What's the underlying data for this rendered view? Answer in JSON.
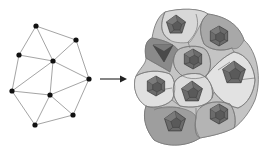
{
  "figure": {
    "left_panel": {
      "title": "point graph",
      "node_color": "#111111",
      "edge_color": "#9a9a9a",
      "nodes": [
        {
          "id": "n0",
          "x": 36,
          "y": 26
        },
        {
          "id": "n1",
          "x": 76,
          "y": 40
        },
        {
          "id": "n2",
          "x": 19,
          "y": 55
        },
        {
          "id": "n3",
          "x": 53,
          "y": 61
        },
        {
          "id": "n4",
          "x": 89,
          "y": 79
        },
        {
          "id": "n5",
          "x": 12,
          "y": 91
        },
        {
          "id": "n6",
          "x": 50,
          "y": 95
        },
        {
          "id": "n7",
          "x": 73,
          "y": 115
        },
        {
          "id": "n8",
          "x": 35,
          "y": 125
        }
      ],
      "edges": [
        [
          "n0",
          "n1"
        ],
        [
          "n0",
          "n2"
        ],
        [
          "n0",
          "n3"
        ],
        [
          "n1",
          "n3"
        ],
        [
          "n1",
          "n4"
        ],
        [
          "n2",
          "n3"
        ],
        [
          "n2",
          "n5"
        ],
        [
          "n3",
          "n4"
        ],
        [
          "n3",
          "n5"
        ],
        [
          "n3",
          "n6"
        ],
        [
          "n4",
          "n6"
        ],
        [
          "n4",
          "n7"
        ],
        [
          "n5",
          "n6"
        ],
        [
          "n5",
          "n8"
        ],
        [
          "n6",
          "n7"
        ],
        [
          "n6",
          "n8"
        ],
        [
          "n7",
          "n8"
        ]
      ]
    },
    "arrow": {
      "x1": 100,
      "y1": 79,
      "x2": 127,
      "y2": 79,
      "color": "#222222"
    },
    "right_panel": {
      "title": "cell tessellation",
      "outline_color": "#6f6f6f",
      "cells": [
        {
          "id": "c_top",
          "cx": 176,
          "cy": 25,
          "shade": "#d8d8d8",
          "poly": "pentagon",
          "poly_r": 10
        },
        {
          "id": "c_topright",
          "cx": 219,
          "cy": 36,
          "shade": "#a8a8a8",
          "poly": "hexagon",
          "poly_r": 10
        },
        {
          "id": "c_left_tri",
          "cx": 163,
          "cy": 52,
          "shade": "#8a8a8a",
          "poly": "triangle",
          "poly_r": 10
        },
        {
          "id": "c_center",
          "cx": 193,
          "cy": 59,
          "shade": "#bdbdbd",
          "poly": "hexagon",
          "poly_r": 10
        },
        {
          "id": "c_right",
          "cx": 234,
          "cy": 73,
          "shade": "#e2e2e2",
          "poly": "pentagon",
          "poly_r": 12
        },
        {
          "id": "c_left",
          "cx": 156,
          "cy": 86,
          "shade": "#e0e0e0",
          "poly": "hexagon",
          "poly_r": 10
        },
        {
          "id": "c_mid",
          "cx": 192,
          "cy": 92,
          "shade": "#dcdcdc",
          "poly": "pentagon",
          "poly_r": 11
        },
        {
          "id": "c_bottom",
          "cx": 175,
          "cy": 122,
          "shade": "#9e9e9e",
          "poly": "pentagon",
          "poly_r": 11
        },
        {
          "id": "c_bottomright",
          "cx": 219,
          "cy": 114,
          "shade": "#b4b4b4",
          "poly": "hexagon",
          "poly_r": 10
        }
      ],
      "polyhedron_fill": "#6b6b6b",
      "polyhedron_edge": "#3a3a3a"
    }
  }
}
